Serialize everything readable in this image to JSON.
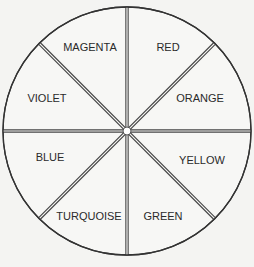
{
  "diagram": {
    "type": "color-wheel",
    "center": [
      127,
      131
    ],
    "radius": 124,
    "segments": [
      {
        "label": "RED",
        "x": 168,
        "y": 48
      },
      {
        "label": "ORANGE",
        "x": 200,
        "y": 99
      },
      {
        "label": "YELLOW",
        "x": 202,
        "y": 161
      },
      {
        "label": "GREEN",
        "x": 163,
        "y": 217
      },
      {
        "label": "TURQUOISE",
        "x": 89,
        "y": 217
      },
      {
        "label": "BLUE",
        "x": 50,
        "y": 158
      },
      {
        "label": "VIOLET",
        "x": 47,
        "y": 99
      },
      {
        "label": "MAGENTA",
        "x": 90,
        "y": 48
      }
    ],
    "colors": {
      "background": "#f4f4f2",
      "line": "#333333"
    }
  }
}
